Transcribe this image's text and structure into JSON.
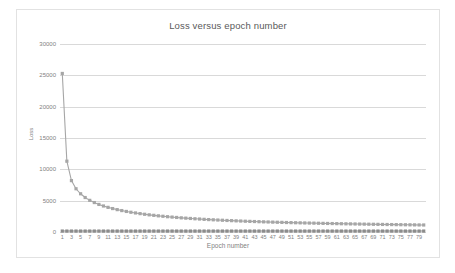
{
  "chart_data": {
    "type": "line",
    "title": "Loss versus epoch number",
    "xlabel": "Epoch number",
    "ylabel": "Loss",
    "xlim": [
      1,
      80
    ],
    "ylim": [
      0,
      30000
    ],
    "yticks": [
      0,
      5000,
      10000,
      15000,
      20000,
      25000,
      30000
    ],
    "ytick_labels": [
      "0",
      "5000",
      "10000",
      "15000",
      "20000",
      "25000",
      "30000"
    ],
    "grid": true,
    "legend": "none",
    "marker": "square",
    "x": [
      1,
      2,
      3,
      4,
      5,
      6,
      7,
      8,
      9,
      10,
      11,
      12,
      13,
      14,
      15,
      16,
      17,
      18,
      19,
      20,
      21,
      22,
      23,
      24,
      25,
      26,
      27,
      28,
      29,
      30,
      31,
      32,
      33,
      34,
      35,
      36,
      37,
      38,
      39,
      40,
      41,
      42,
      43,
      44,
      45,
      46,
      47,
      48,
      49,
      50,
      51,
      52,
      53,
      54,
      55,
      56,
      57,
      58,
      59,
      60,
      61,
      62,
      63,
      64,
      65,
      66,
      67,
      68,
      69,
      70,
      71,
      72,
      73,
      74,
      75,
      76,
      77,
      78,
      79,
      80
    ],
    "xtick_labels": [
      "1",
      "3",
      "5",
      "7",
      "9",
      "11",
      "13",
      "15",
      "17",
      "19",
      "21",
      "23",
      "25",
      "27",
      "29",
      "31",
      "33",
      "35",
      "37",
      "39",
      "41",
      "43",
      "45",
      "47",
      "49",
      "51",
      "53",
      "55",
      "57",
      "59",
      "61",
      "63",
      "65",
      "67",
      "69",
      "71",
      "73",
      "75",
      "77",
      "79"
    ],
    "series": [
      {
        "name": "loss",
        "color": "#a6a6a6",
        "values": [
          25300,
          11300,
          8200,
          6900,
          6100,
          5500,
          5050,
          4700,
          4400,
          4150,
          3930,
          3740,
          3570,
          3420,
          3280,
          3150,
          3040,
          2930,
          2830,
          2740,
          2660,
          2580,
          2510,
          2440,
          2380,
          2320,
          2260,
          2210,
          2160,
          2110,
          2070,
          2020,
          1980,
          1945,
          1910,
          1875,
          1840,
          1810,
          1780,
          1750,
          1720,
          1695,
          1670,
          1645,
          1620,
          1600,
          1575,
          1555,
          1535,
          1515,
          1495,
          1478,
          1460,
          1443,
          1426,
          1410,
          1394,
          1378,
          1363,
          1348,
          1334,
          1320,
          1306,
          1293,
          1280,
          1267,
          1255,
          1243,
          1231,
          1220,
          1208,
          1197,
          1187,
          1176,
          1166,
          1156,
          1146,
          1136,
          1127,
          1118
        ]
      },
      {
        "name": "baseline",
        "color": "#8c8c8c",
        "values": [
          150,
          150,
          150,
          150,
          150,
          150,
          150,
          150,
          150,
          150,
          150,
          150,
          150,
          150,
          150,
          150,
          150,
          150,
          150,
          150,
          150,
          150,
          150,
          150,
          150,
          150,
          150,
          150,
          150,
          150,
          150,
          150,
          150,
          150,
          150,
          150,
          150,
          150,
          150,
          150,
          150,
          150,
          150,
          150,
          150,
          150,
          150,
          150,
          150,
          150,
          150,
          150,
          150,
          150,
          150,
          150,
          150,
          150,
          150,
          150,
          150,
          150,
          150,
          150,
          150,
          150,
          150,
          150,
          150,
          150,
          150,
          150,
          150,
          150,
          150,
          150,
          150,
          150,
          150,
          150
        ]
      }
    ]
  }
}
